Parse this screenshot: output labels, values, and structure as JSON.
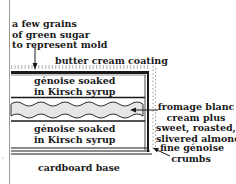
{
  "diagram": {
    "type": "cake cross-section",
    "labels": {
      "mold_note": [
        "a few grains",
        "of green sugar",
        "to represent mold"
      ],
      "coating": "butter cream coating",
      "top_layer": [
        "génoise soaked",
        "in Kirsch syrup"
      ],
      "filling": [
        "fromage blanc",
        "cream plus",
        "sweet, roasted,",
        "slivered almonds"
      ],
      "crumbs": [
        "fine génoise",
        "crumbs"
      ],
      "bottom_layer": [
        "génoise soaked",
        "in Kirsch syrup"
      ],
      "base": "cardboard base"
    },
    "colors": {
      "ink": "#1a1a1a",
      "cream_fill": "#e6e6e6",
      "gutter": "#9a9a9a"
    }
  }
}
